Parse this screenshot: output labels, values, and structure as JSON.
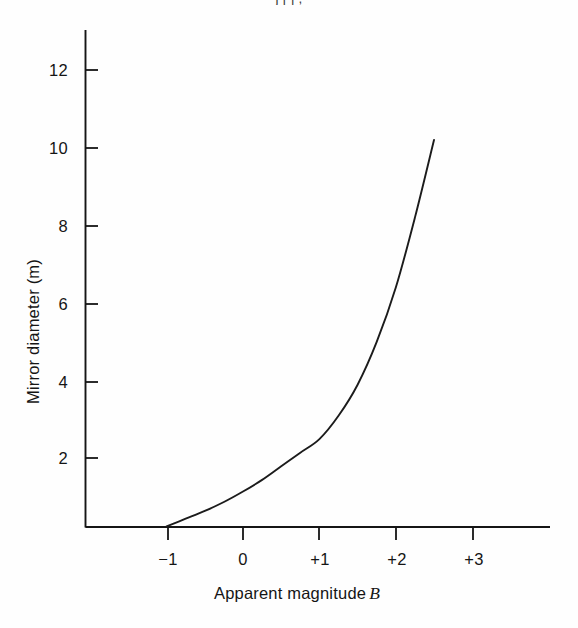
{
  "figure": {
    "clipped_top_text": "j                                                          [      ] ,",
    "background_color": "#fefefe",
    "ink_color": "#151515"
  },
  "chart_data": {
    "type": "line",
    "title": "",
    "subtitle": "",
    "xlabel": "Apparent magnitude",
    "xlabel_symbol": "B",
    "ylabel": "Mirror diameter (m)",
    "xlim": [
      -1.55,
      4.6
    ],
    "ylim": [
      0,
      13.2
    ],
    "grid": false,
    "legend": null,
    "xticks": [
      -1,
      0,
      1,
      2,
      3
    ],
    "xticklabels": [
      "−1",
      "0",
      "+1",
      "+2",
      "+3"
    ],
    "yticks": [
      2,
      4,
      6,
      8,
      10,
      12
    ],
    "yticklabels": [
      "2",
      "4",
      "6",
      "8",
      "10",
      "12"
    ],
    "series": [
      {
        "name": "mirror diameter vs apparent magnitude",
        "x": [
          -1.0,
          -0.75,
          -0.5,
          -0.25,
          0.0,
          0.25,
          0.5,
          0.75,
          1.0,
          1.25,
          1.5,
          1.75,
          2.0,
          2.25,
          2.5
        ],
        "values": [
          0.25,
          0.45,
          0.65,
          0.88,
          1.15,
          1.45,
          1.8,
          2.15,
          2.5,
          3.1,
          3.9,
          5.0,
          6.4,
          8.2,
          10.2
        ]
      }
    ],
    "annotations": []
  },
  "axes": {
    "y_axis_name": "y-axis",
    "x_axis_name": "x-axis"
  }
}
